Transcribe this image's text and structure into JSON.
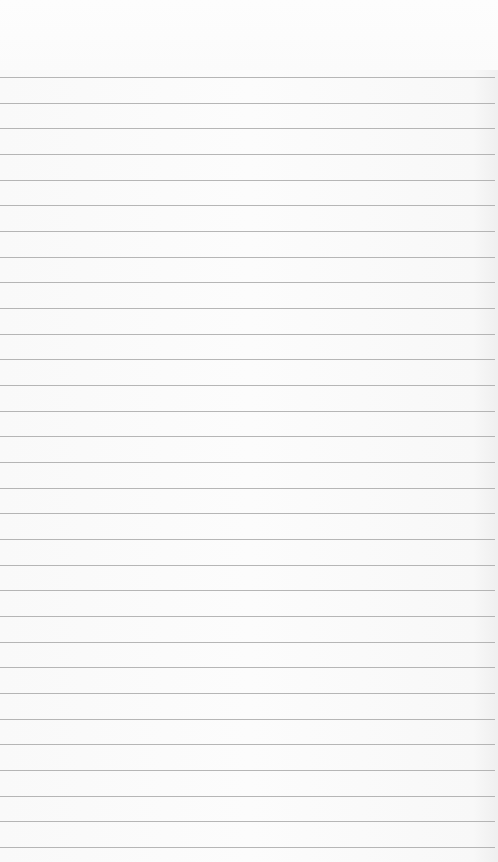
{
  "page": {
    "type": "lined-paper",
    "background_color": "#fafafa",
    "rule_color": "#a9a9a9",
    "first_rule_y": 77,
    "rule_spacing": 25.67,
    "rule_count": 31,
    "content_text": ""
  }
}
